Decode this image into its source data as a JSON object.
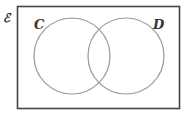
{
  "diagram": {
    "type": "venn",
    "universal_label": "ℰ",
    "sets": [
      {
        "label": "C"
      },
      {
        "label": "D"
      }
    ],
    "colors": {
      "rect_stroke": "#444444",
      "circle_stroke": "#999999",
      "label": "#333333"
    }
  }
}
